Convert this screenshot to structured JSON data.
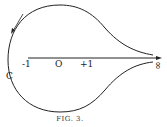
{
  "figure": {
    "caption": "FIG. 3.",
    "labels": {
      "minus_one": "-1",
      "origin": "O",
      "plus_one": "+1",
      "contour": "C",
      "infinity": "∞"
    },
    "colors": {
      "ink": "#222222",
      "background": "#ffffff"
    }
  }
}
